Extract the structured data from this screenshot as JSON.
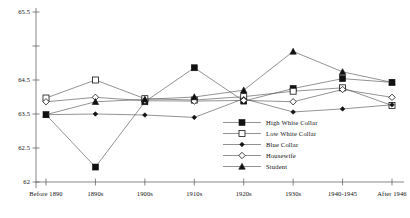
{
  "chart_data": {
    "type": "line",
    "title": "",
    "xlabel": "",
    "ylabel": "",
    "categories": [
      "Before 1890",
      "1890s",
      "1900s",
      "1910s",
      "1920s",
      "1930s",
      "1940-1945",
      "After 1946"
    ],
    "ylim": [
      62,
      65.5
    ],
    "yticks": [
      65.5,
      64.5,
      63.5,
      62.5,
      62
    ],
    "ytick_labels": [
      "65.5",
      "64.5",
      "63.5",
      "62.5",
      "62"
    ],
    "grid": false,
    "legend_position": "lower-right-inside",
    "series": [
      {
        "name": "High White Collar",
        "marker": "filled-square",
        "values": [
          63.48,
          62.22,
          63.86,
          64.68,
          63.88,
          64.25,
          64.52,
          64.43
        ]
      },
      {
        "name": "Low White Collar",
        "marker": "open-square",
        "values": [
          63.97,
          64.5,
          63.95,
          63.91,
          64.01,
          64.17,
          64.27,
          63.75
        ]
      },
      {
        "name": "Blue Collar",
        "marker": "filled-diamond",
        "values": [
          63.48,
          63.5,
          63.47,
          63.4,
          63.95,
          63.56,
          63.65,
          63.77
        ]
      },
      {
        "name": "Housewife",
        "marker": "open-diamond",
        "values": [
          63.86,
          63.99,
          63.89,
          63.88,
          63.9,
          63.86,
          64.22,
          63.99
        ]
      },
      {
        "name": "Student",
        "marker": "filled-triangle",
        "values": [
          63.48,
          63.86,
          63.93,
          64.0,
          64.2,
          64.92,
          64.62,
          64.43
        ]
      }
    ]
  },
  "axes": {
    "y_tick_labels": [
      "65.5",
      "64.5",
      "63.5",
      "62.5",
      "62"
    ],
    "x_tick_labels": [
      "Before 1890",
      "1890s",
      "1900s",
      "1910s",
      "1920s",
      "1930s",
      "1940-1945",
      "After 1946"
    ]
  },
  "legend": {
    "items": [
      {
        "label": "High White Collar",
        "marker": "filled-square"
      },
      {
        "label": "Low White Collar",
        "marker": "open-square"
      },
      {
        "label": "Blue Collar",
        "marker": "filled-diamond"
      },
      {
        "label": "Housewife",
        "marker": "open-diamond"
      },
      {
        "label": "Student",
        "marker": "filled-triangle"
      }
    ]
  },
  "style": {
    "line_color": "#4a4a4a",
    "marker_color": "#111111",
    "axis_color": "#555555",
    "background": "#ffffff"
  }
}
